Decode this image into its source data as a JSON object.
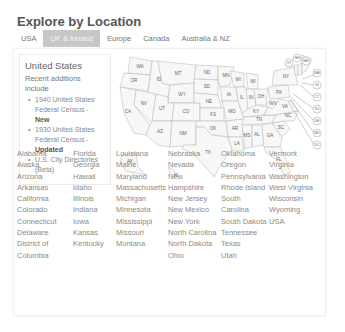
{
  "header": {
    "title": "Explore by Location"
  },
  "tabs": [
    {
      "label": "USA",
      "active": false
    },
    {
      "label": "UK & Ireland",
      "active": true
    },
    {
      "label": "Europe",
      "active": false
    },
    {
      "label": "Canada",
      "active": false
    },
    {
      "label": "Australia & NZ",
      "active": false
    }
  ],
  "info": {
    "title": "United States",
    "intro": "Recent additions include",
    "items": [
      {
        "text": "1940 United States Federal Census - ",
        "tag": "New"
      },
      {
        "text": "1930 United States Federal Census - ",
        "tag": "Updated"
      },
      {
        "text": "U.S. City Directories (Beta)",
        "tag": ""
      }
    ]
  },
  "map": {
    "labels": [
      "WA",
      "OR",
      "CA",
      "ID",
      "NV",
      "MT",
      "WY",
      "UT",
      "AZ",
      "CO",
      "NM",
      "ND",
      "SD",
      "NE",
      "KS",
      "OK",
      "TX",
      "MN",
      "IA",
      "MO",
      "AR",
      "LA",
      "WI",
      "IL",
      "MI",
      "IN",
      "OH",
      "KY",
      "TN",
      "MS",
      "AL",
      "GA",
      "FL",
      "SC",
      "NC",
      "VA",
      "WV",
      "PA",
      "NY",
      "VT",
      "NH",
      "ME",
      "MA",
      "RI",
      "CT",
      "NJ",
      "DE",
      "MD",
      "DC",
      "AK",
      "HI"
    ]
  },
  "states": {
    "columns": [
      [
        "Alabama",
        "Alaska",
        "Arizona",
        "Arkansas",
        "California",
        "Colorado",
        "Connecticut",
        "Delaware",
        "District of Columbia"
      ],
      [
        "Florida",
        "Georgia",
        "Hawaii",
        "Idaho",
        "Illinois",
        "Indiana",
        "Iowa",
        "Kansas",
        "Kentucky"
      ],
      [
        "Louisiana",
        "Maine",
        "Maryland",
        "Massachusetts",
        "Michigan",
        "Minnesota",
        "Mississippi",
        "Missouri",
        "Montana"
      ],
      [
        "Nebraska",
        "Nevada",
        "New Hampshire",
        "New Jersey",
        "New Mexico",
        "New York",
        "North Carolina",
        "North Dakota",
        "Ohio"
      ],
      [
        "Oklahoma",
        "Oregon",
        "Pennsylvania",
        "Rhode Island",
        "South Carolina",
        "South Dakota",
        "Tennessee",
        "Texas",
        "Utah"
      ],
      [
        "Vermont",
        "Virginia",
        "Washington",
        "West Virginia",
        "Wisconsin",
        "Wyoming",
        "USA"
      ]
    ]
  }
}
